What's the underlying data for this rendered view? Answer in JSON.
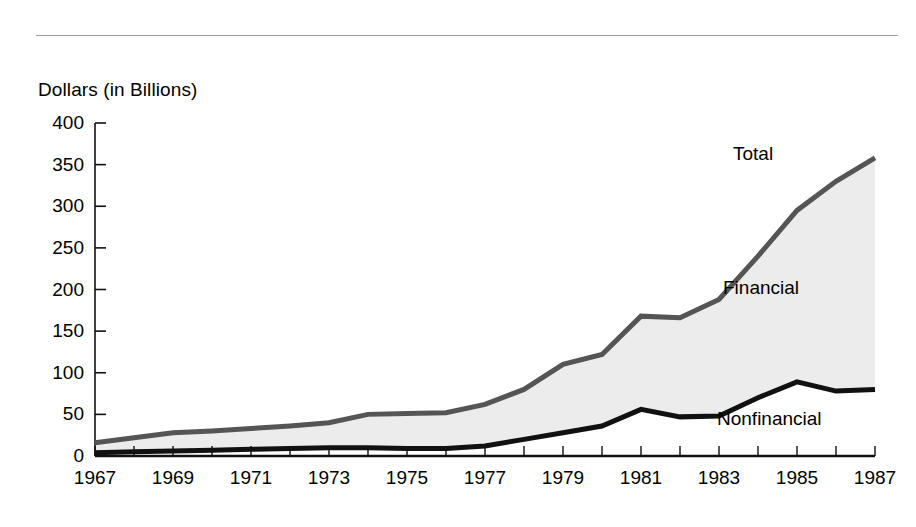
{
  "figure": {
    "y_axis_title": "Dollars (in Billions)",
    "colors": {
      "total_line": "#555555",
      "nonfinancial_line": "#111111",
      "fill": "#ececec",
      "axis": "#111111",
      "rule": "#9a9a9a",
      "background": "#ffffff"
    }
  },
  "chart_data": {
    "type": "area",
    "title": "",
    "subtitle": "",
    "xlabel": "",
    "ylabel": "Dollars (in Billions)",
    "xlim": [
      1967,
      1987
    ],
    "ylim": [
      0,
      400
    ],
    "grid": false,
    "legend_position": "inline-annotations",
    "annotations": [
      "Total",
      "Financial",
      "Nonfinancial"
    ],
    "x": [
      1967,
      1968,
      1969,
      1970,
      1971,
      1972,
      1973,
      1974,
      1975,
      1976,
      1977,
      1978,
      1979,
      1980,
      1981,
      1982,
      1983,
      1984,
      1985,
      1986,
      1987
    ],
    "x_tick_labels": [
      "1967",
      "1969",
      "1971",
      "1973",
      "1975",
      "1977",
      "1979",
      "1981",
      "1983",
      "1985",
      "1987"
    ],
    "y_tick_labels": [
      "400",
      "350",
      "300",
      "250",
      "200",
      "150",
      "100",
      "50",
      "0"
    ],
    "y_ticks": [
      0,
      50,
      100,
      150,
      200,
      250,
      300,
      350,
      400
    ],
    "series": [
      {
        "name": "Total",
        "color": "#555555",
        "values": [
          16,
          22,
          28,
          30,
          33,
          36,
          40,
          50,
          51,
          52,
          62,
          80,
          110,
          122,
          168,
          166,
          188,
          240,
          295,
          330,
          358
        ]
      },
      {
        "name": "Nonfinancial",
        "color": "#111111",
        "values": [
          4,
          5,
          6,
          7,
          8,
          9,
          10,
          10,
          9,
          9,
          12,
          20,
          28,
          36,
          56,
          47,
          48,
          70,
          89,
          78,
          80
        ]
      }
    ],
    "band": {
      "name": "Financial",
      "description": "Area between the Nonfinancial line and the Total line",
      "values": [
        12,
        17,
        22,
        23,
        25,
        27,
        30,
        40,
        42,
        43,
        50,
        60,
        82,
        86,
        112,
        119,
        140,
        170,
        206,
        252,
        278
      ]
    }
  }
}
